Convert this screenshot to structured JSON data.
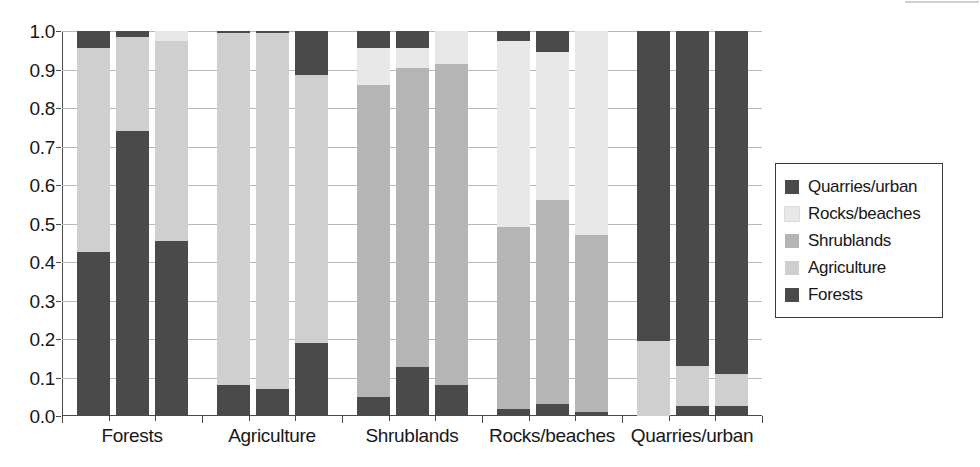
{
  "chart_data": {
    "type": "bar",
    "subtype": "stacked-bar-grouped",
    "title": "",
    "xlabel": "",
    "ylabel": "",
    "ylim": [
      0.0,
      1.0
    ],
    "grid": true,
    "legend_position": "right",
    "stacked_to": 1.0,
    "bars_per_group": 3,
    "ytick_labels": [
      "1.0",
      "0.9",
      "0.8",
      "0.7",
      "0.6",
      "0.5",
      "0.4",
      "0.3",
      "0.2",
      "0.1",
      "0.0"
    ],
    "ytick_values": [
      1.0,
      0.9,
      0.8,
      0.7,
      0.6,
      0.5,
      0.4,
      0.3,
      0.2,
      0.1,
      0.0
    ],
    "categories": [
      "Forests",
      "Agriculture",
      "Shrublands",
      "Rocks/beaches",
      "Quarries/urban"
    ],
    "series": [
      {
        "name": "Forests",
        "color": "#4a4a4a",
        "values": [
          [
            0.425,
            0.74,
            0.455
          ],
          [
            0.08,
            0.07,
            0.19
          ],
          [
            0.05,
            0.128,
            0.08
          ],
          [
            0.018,
            0.03,
            0.01
          ],
          [
            0.0,
            0.025,
            0.025
          ]
        ]
      },
      {
        "name": "Agriculture",
        "color": "#cfcfcf",
        "values": [
          [
            0.53,
            0.245,
            0.52
          ],
          [
            0.915,
            0.925,
            0.695
          ],
          [
            0.0,
            0.0,
            0.0
          ],
          [
            0.0,
            0.0,
            0.0
          ],
          [
            0.195,
            0.105,
            0.085
          ]
        ]
      },
      {
        "name": "Shrublands",
        "color": "#b5b5b5",
        "values": [
          [
            0.0,
            0.0,
            0.0
          ],
          [
            0.0,
            0.0,
            0.0
          ],
          [
            0.81,
            0.777,
            0.835
          ],
          [
            0.472,
            0.53,
            0.46
          ],
          [
            0.0,
            0.0,
            0.0
          ]
        ]
      },
      {
        "name": "Rocks/beaches",
        "color": "#e8e8e8",
        "values": [
          [
            0.0,
            0.0,
            0.025
          ],
          [
            0.0,
            0.0,
            0.0
          ],
          [
            0.095,
            0.05,
            0.085
          ],
          [
            0.485,
            0.385,
            0.53
          ],
          [
            0.0,
            0.0,
            0.0
          ]
        ]
      },
      {
        "name": "Quarries/urban",
        "color": "#4a4a4a",
        "values": [
          [
            0.045,
            0.015,
            0.0
          ],
          [
            0.005,
            0.005,
            0.115
          ],
          [
            0.045,
            0.045,
            0.0
          ],
          [
            0.025,
            0.055,
            0.0
          ],
          [
            0.805,
            0.87,
            0.89
          ]
        ]
      }
    ],
    "stack_order_bottom_to_top": [
      "Forests",
      "Agriculture",
      "Shrublands",
      "Rocks/beaches",
      "Quarries/urban"
    ]
  },
  "legend": {
    "items": [
      {
        "label": "Quarries/urban",
        "color": "#4a4a4a"
      },
      {
        "label": "Rocks/beaches",
        "color": "#e8e8e8"
      },
      {
        "label": "Shrublands",
        "color": "#b5b5b5"
      },
      {
        "label": "Agriculture",
        "color": "#cfcfcf"
      },
      {
        "label": "Forests",
        "color": "#4a4a4a"
      }
    ]
  },
  "axis": {
    "y_labels": [
      "1.0",
      "0.9",
      "0.8",
      "0.7",
      "0.6",
      "0.5",
      "0.4",
      "0.3",
      "0.2",
      "0.1",
      "0.0"
    ],
    "x_labels": [
      "Forests",
      "Agriculture",
      "Shrublands",
      "Rocks/beaches",
      "Quarries/urban"
    ]
  }
}
